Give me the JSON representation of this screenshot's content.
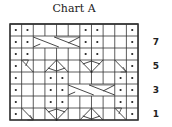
{
  "title": "Chart A",
  "grid": {
    "columns": 11,
    "rows": 8,
    "x0": 10,
    "y0": 24,
    "cell_w": 11.64,
    "cell_h": 12,
    "line_color": "#333333"
  },
  "row_labels": [
    {
      "row": 7,
      "label": "7"
    },
    {
      "row": 5,
      "label": "5"
    },
    {
      "row": 3,
      "label": "3"
    },
    {
      "row": 1,
      "label": "1"
    }
  ],
  "legend_symbols": {
    "dot": "purl",
    "blank": "knit",
    "cable4": "4-stitch cable cross",
    "twist_r": "right twist",
    "twist_l": "left twist",
    "peak": "decrease/peak",
    "vee": "increase/vee"
  },
  "chart_rows": [
    {
      "row": 8,
      "cells": [
        "dot",
        "dot",
        "",
        "",
        "",
        "",
        "dot",
        "dot",
        "",
        "",
        "dot"
      ]
    },
    {
      "row": 7,
      "cells": [
        "dot",
        "dot",
        "cable4:3-6",
        "",
        "",
        "",
        "dot",
        "dot",
        "",
        "",
        "dot"
      ]
    },
    {
      "row": 6,
      "cells": [
        "dot",
        "dot",
        "",
        "",
        "",
        "",
        "dot",
        "dot",
        "",
        "",
        "dot"
      ]
    },
    {
      "row": 5,
      "cells": [
        "dot",
        "twist_r",
        "",
        "peak:4-5",
        "",
        "",
        "vee:7-8",
        "",
        "",
        "twist_l",
        "dot"
      ]
    },
    {
      "row": 4,
      "cells": [
        "dot",
        "",
        "",
        "dot",
        "dot",
        "",
        "",
        "",
        "",
        "dot",
        "dot"
      ]
    },
    {
      "row": 3,
      "cells": [
        "dot",
        "",
        "",
        "dot",
        "dot",
        "cable4:6-9",
        "",
        "",
        "",
        "dot",
        "dot"
      ]
    },
    {
      "row": 2,
      "cells": [
        "dot",
        "",
        "",
        "dot",
        "dot",
        "",
        "",
        "",
        "",
        "dot",
        "dot"
      ]
    },
    {
      "row": 1,
      "cells": [
        "dot",
        "twist_l",
        "",
        "vee:4-5",
        "",
        "",
        "peak:7-8",
        "",
        "",
        "twist_r",
        "dot"
      ]
    }
  ]
}
